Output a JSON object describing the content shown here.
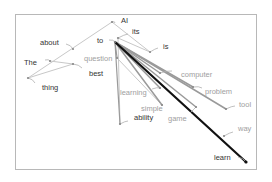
{
  "diagram": {
    "type": "word-association-graph",
    "colors": {
      "frame": "#b8b8b8",
      "dark": "#111111",
      "mid": "#9a9a9a",
      "light": "#c8c8c8",
      "labelDark": "#333333",
      "labelLight": "#a0a0a0"
    },
    "nodes": [
      {
        "id": "AI",
        "label": "AI",
        "x": 112,
        "y": 22,
        "lx": 121,
        "ly": 20,
        "tone": "dark",
        "cx": 115,
        "cy": 23
      },
      {
        "id": "its",
        "label": "its",
        "x": 118,
        "y": 38,
        "lx": 132,
        "ly": 31,
        "tone": "dark",
        "cx": 128,
        "cy": 34
      },
      {
        "id": "is",
        "label": "is",
        "x": 150,
        "y": 52,
        "lx": 163,
        "ly": 46,
        "tone": "dark",
        "cx": 158,
        "cy": 48
      },
      {
        "id": "about",
        "label": "about",
        "x": 73,
        "y": 49,
        "lx": 40,
        "ly": 42,
        "tone": "dark",
        "cx": 66,
        "cy": 44
      },
      {
        "id": "to",
        "label": "to",
        "x": 115,
        "y": 42,
        "lx": 97,
        "ly": 40,
        "tone": "dark",
        "cx": 109,
        "cy": 40
      },
      {
        "id": "question",
        "label": "question",
        "x": 117,
        "y": 58,
        "lx": 84,
        "ly": 58,
        "tone": "light",
        "cx": 115,
        "cy": 55
      },
      {
        "id": "The",
        "label": "The",
        "x": 50,
        "y": 61,
        "lx": 24,
        "ly": 62,
        "tone": "dark",
        "cx": 45,
        "cy": 60
      },
      {
        "id": "best",
        "label": "best",
        "x": 73,
        "y": 64,
        "lx": 89,
        "ly": 73,
        "tone": "dark",
        "cx": 82,
        "cy": 68
      },
      {
        "id": "thing",
        "label": "thing",
        "x": 28,
        "y": 78,
        "lx": 42,
        "ly": 87,
        "tone": "dark",
        "cx": 35,
        "cy": 83
      },
      {
        "id": "computer",
        "label": "computer",
        "x": 160,
        "y": 73,
        "lx": 181,
        "ly": 74,
        "tone": "light",
        "cx": 172,
        "cy": 71
      },
      {
        "id": "problem",
        "label": "problem",
        "x": 193,
        "y": 87,
        "lx": 205,
        "ly": 91,
        "tone": "light",
        "cx": 202,
        "cy": 88
      },
      {
        "id": "learning",
        "label": "learning",
        "x": 160,
        "y": 88,
        "lx": 120,
        "ly": 92,
        "tone": "light",
        "cx": 152,
        "cy": 89
      },
      {
        "id": "simple",
        "label": "simple",
        "x": 162,
        "y": 105,
        "lx": 141,
        "ly": 108,
        "tone": "light",
        "cx": 160,
        "cy": 104
      },
      {
        "id": "game",
        "label": "game",
        "x": 196,
        "y": 107,
        "lx": 168,
        "ly": 118,
        "tone": "light",
        "cx": 190,
        "cy": 113
      },
      {
        "id": "tool",
        "label": "tool",
        "x": 226,
        "y": 109,
        "lx": 239,
        "ly": 104,
        "tone": "light",
        "cx": 235,
        "cy": 106
      },
      {
        "id": "ability",
        "label": "ability",
        "x": 120,
        "y": 124,
        "lx": 134,
        "ly": 117,
        "tone": "dark",
        "cx": 128,
        "cy": 121
      },
      {
        "id": "way",
        "label": "way",
        "x": 224,
        "y": 136,
        "lx": 238,
        "ly": 128,
        "tone": "light",
        "cx": 233,
        "cy": 132
      },
      {
        "id": "learn",
        "label": "learn",
        "x": 246,
        "y": 162,
        "lx": 214,
        "ly": 157,
        "tone": "dark",
        "cx": 238,
        "cy": 157
      }
    ],
    "edges": [
      {
        "from": "AI",
        "to": "thing",
        "w": 1,
        "tone": "light"
      },
      {
        "from": "AI",
        "to": "is",
        "w": 1,
        "tone": "light"
      },
      {
        "from": "its",
        "to": "is",
        "w": 1,
        "tone": "light"
      },
      {
        "from": "its",
        "to": "ability",
        "w": 1,
        "tone": "light"
      },
      {
        "from": "The",
        "to": "best",
        "w": 1,
        "tone": "light"
      },
      {
        "from": "thing",
        "to": "best",
        "w": 1,
        "tone": "light"
      },
      {
        "from": "to",
        "to": "question",
        "w": 1.2,
        "tone": "mid"
      },
      {
        "from": "to",
        "to": "ability",
        "w": 1.2,
        "tone": "mid"
      },
      {
        "from": "to",
        "to": "computer",
        "w": 1.5,
        "tone": "mid"
      },
      {
        "from": "to",
        "to": "problem",
        "w": 1.5,
        "tone": "mid"
      },
      {
        "from": "to",
        "to": "learning",
        "w": 1.5,
        "tone": "mid"
      },
      {
        "from": "to",
        "to": "simple",
        "w": 1.5,
        "tone": "mid"
      },
      {
        "from": "to",
        "to": "game",
        "w": 1.5,
        "tone": "mid"
      },
      {
        "from": "to",
        "to": "tool",
        "w": 1.5,
        "tone": "mid"
      },
      {
        "from": "to",
        "to": "learn",
        "w": 2.2,
        "tone": "dark"
      },
      {
        "from": "question",
        "to": "simple",
        "w": 1,
        "tone": "light"
      }
    ]
  }
}
